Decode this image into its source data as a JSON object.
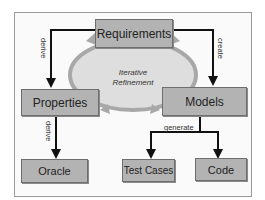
{
  "diagram": {
    "center": {
      "line1": "Iterative",
      "line2": "Refinement"
    },
    "nodes": {
      "requirements": "Requirements",
      "properties": "Properties",
      "models": "Models",
      "oracle": "Oracle",
      "test_cases": "Test Cases",
      "code": "Code"
    },
    "edges": {
      "req_to_props": "derive",
      "req_to_models": "create",
      "props_to_oracle": "derive",
      "models_to_outputs": "generate"
    },
    "colors": {
      "box_fill": "#b3b3b3",
      "cycle_fill": "#dcdcdc",
      "cycle_arrow": "#a8a8a8",
      "edge": "#111111"
    }
  }
}
